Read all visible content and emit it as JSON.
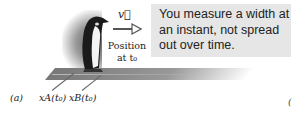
{
  "figure": {
    "velocity_label": "v⃗",
    "position_label_line1": "Position",
    "position_label_line2": "at t₀",
    "callout_text": "You measure a width at an instant, not spread out over time.",
    "panel_a_label": "(a)",
    "xA_label": "x_A(t₀)",
    "xB_label": "x_B(t₀)",
    "xA_display": "xA(t₀)",
    "xB_display": "xB(t₀)",
    "panel_b_label_partial": "(",
    "colors": {
      "callout_bg": "#e6e6e6",
      "text": "#222222",
      "arrow": "#555555"
    }
  }
}
